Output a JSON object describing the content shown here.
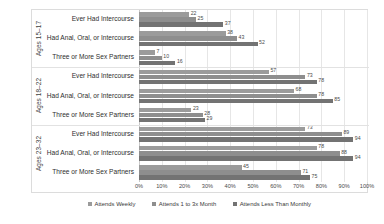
{
  "chart_data": {
    "type": "bar",
    "orientation": "horizontal",
    "title": "",
    "subtitle": "",
    "xlabel": "",
    "ylabel": "",
    "xlim": [
      0,
      100
    ],
    "grid": true,
    "legend_position": "bottom",
    "xticks": [
      "0%",
      "10%",
      "20%",
      "30%",
      "40%",
      "50%",
      "60%",
      "70%",
      "80%",
      "90%",
      "100%"
    ],
    "xtick_values": [
      0,
      10,
      20,
      30,
      40,
      50,
      60,
      70,
      80,
      90,
      100
    ],
    "series": [
      {
        "name": "Attends Weekly",
        "color": "#9b9b9b"
      },
      {
        "name": "Attends 1 to 3x Month",
        "color": "#8e8e8e"
      },
      {
        "name": "Attends Less Than Monthly",
        "color": "#737373"
      }
    ],
    "groups": [
      {
        "label": "Ages 15–17",
        "categories": [
          {
            "label": "Ever Had Intercourse",
            "values": [
              22,
              25,
              37
            ]
          },
          {
            "label": "Had Anal, Oral, or Intercourse",
            "values": [
              38,
              43,
              52
            ]
          },
          {
            "label": "Three or More Sex Partners",
            "values": [
              7,
              10,
              16
            ]
          }
        ]
      },
      {
        "label": "Ages 18–22",
        "categories": [
          {
            "label": "Ever Had Intercourse",
            "values": [
              57,
              73,
              78
            ]
          },
          {
            "label": "Had Anal, Oral, or Intercourse",
            "values": [
              68,
              78,
              85
            ]
          },
          {
            "label": "Three or More Sex Partners",
            "values": [
              23,
              28,
              29
            ]
          }
        ]
      },
      {
        "label": "Ages 23–32",
        "categories": [
          {
            "label": "Ever Had Intercourse",
            "values": [
              73,
              89,
              94
            ]
          },
          {
            "label": "Had Anal, Oral, or Intercourse",
            "values": [
              78,
              88,
              94
            ]
          },
          {
            "label": "Three or More Sex Partners",
            "values": [
              45,
              71,
              75
            ]
          }
        ]
      }
    ]
  }
}
